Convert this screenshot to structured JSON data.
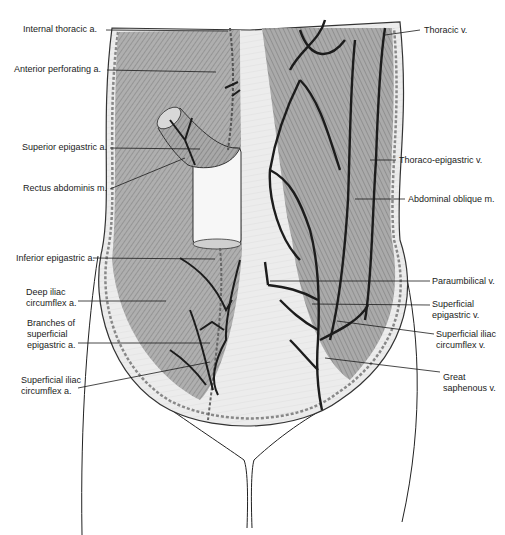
{
  "figure": {
    "colors": {
      "skin": "#e9e9e9",
      "muscle": "#9d9d9d",
      "muscle_dark": "#7a7a7a",
      "vessel": "#1c1c1c",
      "outline": "#2a2a2a",
      "fascia": "#f4f4f4"
    }
  },
  "labels_left": [
    {
      "id": "internal-thoracic-a",
      "text": "Internal thoracic a."
    },
    {
      "id": "anterior-perforating-a",
      "text": "Anterior perforating a."
    },
    {
      "id": "superior-epigastric-a",
      "text": "Superior epigastric a."
    },
    {
      "id": "rectus-abdominis-m",
      "text": "Rectus abdominis m."
    },
    {
      "id": "inferior-epigastric-a",
      "text": "Inferior epigastric a."
    },
    {
      "id": "deep-iliac-circumflex-a",
      "text": "Deep iliac\ncircumflex a."
    },
    {
      "id": "branches-superficial-epigastric-a",
      "text": "Branches of\nsuperficial\nepigastric a."
    },
    {
      "id": "superficial-iliac-circumflex-a",
      "text": "Superficial iliac\ncircumflex a."
    }
  ],
  "labels_right": [
    {
      "id": "thoracic-v",
      "text": "Thoracic v."
    },
    {
      "id": "thoraco-epigastric-v",
      "text": "Thoraco-epigastric v."
    },
    {
      "id": "abdominal-oblique-m",
      "text": "Abdominal oblique m."
    },
    {
      "id": "paraumbilical-v",
      "text": "Paraumbilical v."
    },
    {
      "id": "superficial-epigastric-v",
      "text": "Superficial\nepigastric v."
    },
    {
      "id": "superficial-iliac-circumflex-v",
      "text": "Superficial iliac\ncircumflex v."
    },
    {
      "id": "great-saphenous-v",
      "text": "Great\nsaphenous v."
    }
  ]
}
